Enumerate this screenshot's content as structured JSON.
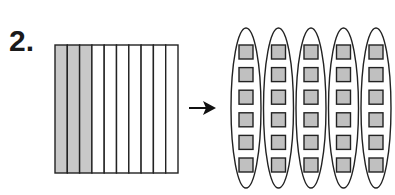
{
  "problem": {
    "number": "2.",
    "grid": {
      "columns": 10,
      "shaded_columns": 3,
      "shade_color": "#c8c8c8"
    },
    "arrow": "right-arrow",
    "groups": {
      "count": 5,
      "items_per_group": 6,
      "item_color": "#c0c0c0"
    }
  }
}
